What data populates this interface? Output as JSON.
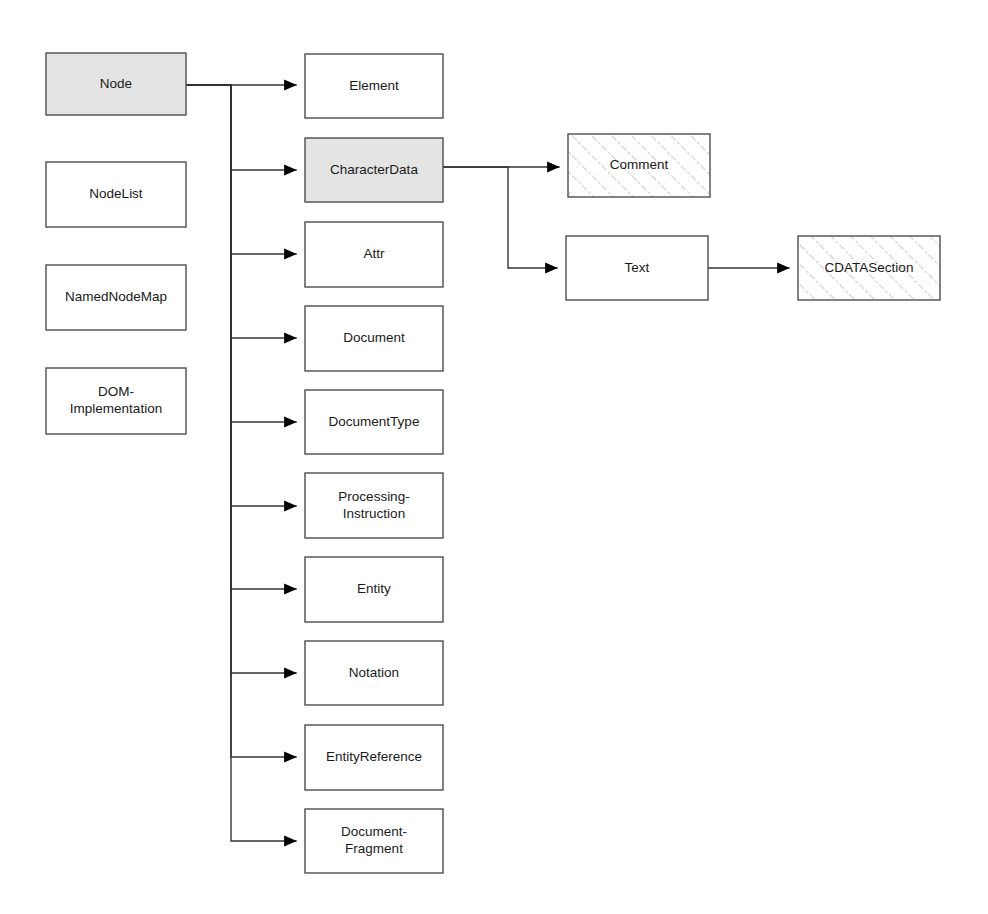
{
  "diagram": {
    "type": "class-hierarchy",
    "canvas": {
      "width": 988,
      "height": 914
    },
    "colors": {
      "background": "#ffffff",
      "box_stroke": "#4d4d4d",
      "box_fill_plain": "#ffffff",
      "box_fill_shaded": "#e4e4e4",
      "hatch_line": "#b9b9bf",
      "edge": "#333333",
      "label_text": "#1a1a1a"
    },
    "legend_styles": {
      "plain": "white fill, abstract/concrete node type",
      "shaded": "gray fill, base interface",
      "hatched": "diagonal hatch fill, leaf node type"
    },
    "nodes": [
      {
        "id": "node",
        "label": "Node",
        "label_lines": [
          "Node"
        ],
        "x": 46,
        "y": 53,
        "w": 140,
        "h": 62,
        "style": "shaded"
      },
      {
        "id": "nodelist",
        "label": "NodeList",
        "label_lines": [
          "NodeList"
        ],
        "x": 46,
        "y": 162,
        "w": 140,
        "h": 65,
        "style": "plain"
      },
      {
        "id": "namednodemap",
        "label": "NamedNodeMap",
        "label_lines": [
          "NamedNodeMap"
        ],
        "x": 46,
        "y": 265,
        "w": 140,
        "h": 65,
        "style": "plain"
      },
      {
        "id": "domimplementation",
        "label": "DOM-Implementation",
        "label_lines": [
          "DOM-",
          "Implementation"
        ],
        "x": 46,
        "y": 368,
        "w": 140,
        "h": 66,
        "style": "plain"
      },
      {
        "id": "element",
        "label": "Element",
        "label_lines": [
          "Element"
        ],
        "x": 305,
        "y": 54,
        "w": 138,
        "h": 64,
        "style": "plain"
      },
      {
        "id": "characterdata",
        "label": "CharacterData",
        "label_lines": [
          "CharacterData"
        ],
        "x": 305,
        "y": 138,
        "w": 138,
        "h": 64,
        "style": "shaded"
      },
      {
        "id": "attr",
        "label": "Attr",
        "label_lines": [
          "Attr"
        ],
        "x": 305,
        "y": 222,
        "w": 138,
        "h": 65,
        "style": "plain"
      },
      {
        "id": "document",
        "label": "Document",
        "label_lines": [
          "Document"
        ],
        "x": 305,
        "y": 306,
        "w": 138,
        "h": 65,
        "style": "plain"
      },
      {
        "id": "documenttype",
        "label": "DocumentType",
        "label_lines": [
          "DocumentType"
        ],
        "x": 305,
        "y": 390,
        "w": 138,
        "h": 64,
        "style": "plain"
      },
      {
        "id": "processinginstruction",
        "label": "Processing-Instruction",
        "label_lines": [
          "Processing-",
          "Instruction"
        ],
        "x": 305,
        "y": 473,
        "w": 138,
        "h": 65,
        "style": "plain"
      },
      {
        "id": "entity",
        "label": "Entity",
        "label_lines": [
          "Entity"
        ],
        "x": 305,
        "y": 557,
        "w": 138,
        "h": 65,
        "style": "plain"
      },
      {
        "id": "notation",
        "label": "Notation",
        "label_lines": [
          "Notation"
        ],
        "x": 305,
        "y": 641,
        "w": 138,
        "h": 64,
        "style": "plain"
      },
      {
        "id": "entityreference",
        "label": "EntityReference",
        "label_lines": [
          "EntityReference"
        ],
        "x": 305,
        "y": 725,
        "w": 138,
        "h": 65,
        "style": "plain"
      },
      {
        "id": "documentfragment",
        "label": "Document-Fragment",
        "label_lines": [
          "Document-",
          "Fragment"
        ],
        "x": 305,
        "y": 809,
        "w": 138,
        "h": 64,
        "style": "plain"
      },
      {
        "id": "comment",
        "label": "Comment",
        "label_lines": [
          "Comment"
        ],
        "x": 568,
        "y": 134,
        "w": 142,
        "h": 63,
        "style": "hatched"
      },
      {
        "id": "text",
        "label": "Text",
        "label_lines": [
          "Text"
        ],
        "x": 566,
        "y": 236,
        "w": 142,
        "h": 64,
        "style": "plain"
      },
      {
        "id": "cdatasection",
        "label": "CDATASection",
        "label_lines": [
          "CDATASection"
        ],
        "x": 798,
        "y": 236,
        "w": 142,
        "h": 64,
        "style": "hatched"
      }
    ],
    "edges": [
      {
        "id": "node-to-element",
        "from": "node",
        "to": "element",
        "kind": "elbow-trunk",
        "trunk_x": 231,
        "from_y": 85,
        "to_y": 85
      },
      {
        "id": "node-to-characterdata",
        "from": "node",
        "to": "characterdata",
        "kind": "elbow-trunk",
        "trunk_x": 231,
        "from_y": 85,
        "to_y": 170
      },
      {
        "id": "node-to-attr",
        "from": "node",
        "to": "attr",
        "kind": "elbow-trunk",
        "trunk_x": 231,
        "from_y": 85,
        "to_y": 254
      },
      {
        "id": "node-to-document",
        "from": "node",
        "to": "document",
        "kind": "elbow-trunk",
        "trunk_x": 231,
        "from_y": 85,
        "to_y": 338
      },
      {
        "id": "node-to-documenttype",
        "from": "node",
        "to": "documenttype",
        "kind": "elbow-trunk",
        "trunk_x": 231,
        "from_y": 85,
        "to_y": 422
      },
      {
        "id": "node-to-processinginstruction",
        "from": "node",
        "to": "processinginstruction",
        "kind": "elbow-trunk",
        "trunk_x": 231,
        "from_y": 85,
        "to_y": 506
      },
      {
        "id": "node-to-entity",
        "from": "node",
        "to": "entity",
        "kind": "elbow-trunk",
        "trunk_x": 231,
        "from_y": 85,
        "to_y": 589
      },
      {
        "id": "node-to-notation",
        "from": "node",
        "to": "notation",
        "kind": "elbow-trunk",
        "trunk_x": 231,
        "from_y": 85,
        "to_y": 673
      },
      {
        "id": "node-to-entityreference",
        "from": "node",
        "to": "entityreference",
        "kind": "elbow-trunk",
        "trunk_x": 231,
        "from_y": 85,
        "to_y": 757
      },
      {
        "id": "node-to-documentfragment",
        "from": "node",
        "to": "documentfragment",
        "kind": "elbow-trunk",
        "trunk_x": 231,
        "from_y": 85,
        "to_y": 841
      },
      {
        "id": "characterdata-to-comment",
        "from": "characterdata",
        "to": "comment",
        "kind": "elbow-trunk",
        "trunk_x": 508,
        "from_y": 167,
        "to_y": 167
      },
      {
        "id": "characterdata-to-text",
        "from": "characterdata",
        "to": "text",
        "kind": "elbow-trunk",
        "trunk_x": 508,
        "from_y": 167,
        "to_y": 268
      },
      {
        "id": "text-to-cdatasection",
        "from": "text",
        "to": "cdatasection",
        "kind": "straight",
        "from_y": 268,
        "to_y": 268
      }
    ]
  }
}
